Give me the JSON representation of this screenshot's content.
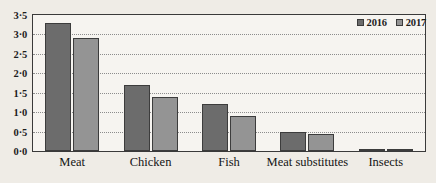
{
  "chart_data": {
    "type": "bar",
    "title": "",
    "xlabel": "",
    "ylabel": "",
    "categories": [
      "Meat",
      "Chicken",
      "Fish",
      "Meat substitutes",
      "Insects"
    ],
    "series": [
      {
        "name": "2016",
        "color": "#6c6c6c",
        "values": [
          3.3,
          1.7,
          1.2,
          0.5,
          0.05
        ]
      },
      {
        "name": "2017",
        "color": "#949494",
        "values": [
          2.9,
          1.4,
          0.9,
          0.45,
          0.05
        ]
      }
    ],
    "ylim": [
      0,
      3.5
    ],
    "ytick_values": [
      0,
      0.5,
      1.0,
      1.5,
      2.0,
      2.5,
      3.0,
      3.5
    ],
    "ytick_labels": [
      "0·0",
      "0·5",
      "1·0",
      "1·5",
      "2·0",
      "2·5",
      "3·0",
      "3·5"
    ],
    "grid": true,
    "grid_style": "dotted-horizontal",
    "legend": {
      "position": "top-right",
      "entries": [
        "2016",
        "2017"
      ]
    },
    "background_color": "#efece6",
    "plot_background_color": "#f6f4f0",
    "axis_color": "#3a3a3a"
  }
}
